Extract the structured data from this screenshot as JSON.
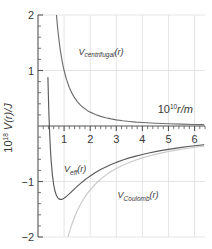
{
  "chart_data": {
    "type": "line",
    "title": "",
    "xlabel": "10^10 r/m",
    "ylabel": "10^18 V(r)/J",
    "xlim": [
      0,
      6.4
    ],
    "ylim": [
      -2,
      2
    ],
    "xticks": [
      1,
      2,
      3,
      4,
      5,
      6
    ],
    "yticks": [
      2,
      1,
      -1,
      -2
    ],
    "grid": true,
    "minor_ticks": true,
    "axis_position": "zero-crossing-x-axis",
    "series": [
      {
        "name": "V_centrifugal(r)",
        "label": "V",
        "label_sub": "centrifugal",
        "label_suffix": "(r)",
        "color": "#6e6e6e",
        "form": "A/r^2",
        "A": 1.0,
        "asymptote": 0,
        "label_x": 1.55,
        "label_y": 1.28,
        "points_x": [
          0.7,
          0.75,
          0.8,
          0.85,
          0.9,
          0.95,
          1.0,
          1.1,
          1.2,
          1.3,
          1.4,
          1.5,
          1.6,
          1.7,
          1.8,
          1.9,
          2.0,
          2.2,
          2.4,
          2.6,
          2.8,
          3.0,
          3.25,
          3.5,
          3.75,
          4.0,
          4.5,
          5.0,
          5.5,
          6.0,
          6.35
        ],
        "points_y": [
          2.041,
          1.778,
          1.563,
          1.384,
          1.235,
          1.108,
          1.0,
          0.826,
          0.694,
          0.592,
          0.51,
          0.444,
          0.391,
          0.346,
          0.309,
          0.277,
          0.25,
          0.207,
          0.174,
          0.148,
          0.128,
          0.111,
          0.095,
          0.082,
          0.071,
          0.063,
          0.049,
          0.04,
          0.033,
          0.028,
          0.025
        ]
      },
      {
        "name": "V_Coulomb(r)",
        "label": "V",
        "label_sub": "Coulomb",
        "label_suffix": "(r)",
        "color": "#c9c9c9",
        "form": "-B/r",
        "B": 2.3,
        "asymptote": 0,
        "label_x": 3.05,
        "label_y": -1.3,
        "points_x": [
          1.15,
          1.2,
          1.3,
          1.4,
          1.5,
          1.6,
          1.7,
          1.8,
          1.9,
          2.0,
          2.2,
          2.4,
          2.6,
          2.8,
          3.0,
          3.25,
          3.5,
          3.75,
          4.0,
          4.25,
          4.5,
          4.75,
          5.0,
          5.25,
          5.5,
          5.75,
          6.0,
          6.35
        ],
        "points_y": [
          -2.0,
          -1.917,
          -1.769,
          -1.643,
          -1.533,
          -1.438,
          -1.353,
          -1.278,
          -1.211,
          -1.15,
          -1.045,
          -0.958,
          -0.885,
          -0.821,
          -0.767,
          -0.708,
          -0.657,
          -0.613,
          -0.575,
          -0.541,
          -0.511,
          -0.484,
          -0.46,
          -0.438,
          -0.418,
          -0.4,
          -0.383,
          -0.362
        ]
      },
      {
        "name": "V_eff(r)",
        "label": "V",
        "label_sub": "eff",
        "label_suffix": "(r)",
        "color": "#5a5a5a",
        "form": "A/r^2 - B/r",
        "A": 1.0,
        "B": 2.3,
        "zero_crossing": 0.435,
        "minimum_x": 0.87,
        "minimum_y": -1.1,
        "asymptote": 0,
        "label_x": 1.0,
        "label_y": -0.83,
        "points_x": [
          0.38,
          0.4,
          0.42,
          0.45,
          0.48,
          0.5,
          0.55,
          0.6,
          0.65,
          0.7,
          0.75,
          0.8,
          0.85,
          0.9,
          0.95,
          1.0,
          1.05,
          1.1,
          1.2,
          1.3,
          1.4,
          1.5,
          1.6,
          1.7,
          1.8,
          1.9,
          2.0,
          2.2,
          2.4,
          2.6,
          2.8,
          3.0,
          3.25,
          3.5,
          3.75,
          4.0,
          4.25,
          4.5,
          4.75,
          5.0,
          5.25,
          5.5,
          5.75,
          6.0,
          6.35
        ],
        "points_y": [
          0.873,
          0.5,
          0.191,
          -0.171,
          -0.453,
          -0.6,
          -0.876,
          -1.055,
          -1.171,
          -1.245,
          -1.29,
          -1.313,
          -1.322,
          -1.322,
          -1.314,
          -1.3,
          -1.283,
          -1.264,
          -1.222,
          -1.177,
          -1.133,
          -1.089,
          -1.047,
          -1.007,
          -0.969,
          -0.934,
          -0.9,
          -0.839,
          -0.784,
          -0.737,
          -0.694,
          -0.656,
          -0.613,
          -0.575,
          -0.542,
          -0.513,
          -0.486,
          -0.462,
          -0.44,
          -0.42,
          -0.402,
          -0.385,
          -0.37,
          -0.355,
          -0.337
        ]
      }
    ]
  },
  "labels": {
    "y_axis": {
      "mantissa": "10",
      "exponent": "18",
      "rest": "V(r)/J"
    },
    "x_axis": {
      "mantissa": "10",
      "exponent": "10",
      "rest": "r/m"
    },
    "ytick_2": "2",
    "ytick_1": "1",
    "ytick_m1": "−1",
    "ytick_m2": "−2",
    "xtick_1": "1",
    "xtick_2": "2",
    "xtick_3": "3",
    "xtick_4": "4",
    "xtick_5": "5",
    "xtick_6": "6",
    "centrifugal_v": "V",
    "centrifugal_sub": "centrifugal",
    "centrifugal_arg": "(r)",
    "coulomb_v": "V",
    "coulomb_sub": "Coulomb",
    "coulomb_arg": "(r)",
    "eff_v": "V",
    "eff_sub": "eff",
    "eff_arg": "(r)"
  },
  "colors": {
    "centrifugal": "#6e6e6e",
    "coulomb": "#c9c9c9",
    "eff": "#5a5a5a",
    "axis": "#555555",
    "grid": "#dedede",
    "text": "#3a3a3a"
  }
}
